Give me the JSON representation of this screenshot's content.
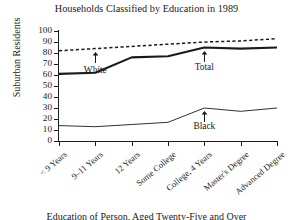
{
  "chart_data": {
    "type": "line",
    "title": "Households Classified by Education in 1989",
    "xlabel": "Education of Person, Aged Twenty-Five and Over",
    "ylabel": "Suburban Residents",
    "categories": [
      "< 9 Years",
      "9–11 Years",
      "12 Years",
      "Some College",
      "College, 4 Years",
      "Master's Degree",
      "Advanced Degree"
    ],
    "ylim": [
      0,
      100
    ],
    "yticks": [
      0,
      10,
      20,
      30,
      40,
      50,
      60,
      70,
      80,
      90,
      100
    ],
    "grid": false,
    "legend": "inline-annotations",
    "series": [
      {
        "name": "White",
        "style": "dashed",
        "values": [
          82,
          84,
          86,
          88,
          90,
          91,
          93
        ]
      },
      {
        "name": "Total",
        "style": "solid-thick",
        "values": [
          61,
          62,
          76,
          77,
          85,
          84,
          85
        ]
      },
      {
        "name": "Black",
        "style": "solid-thin",
        "values": [
          14,
          13,
          15,
          17,
          30,
          27,
          30
        ]
      }
    ],
    "annotations": [
      {
        "label": "White",
        "series": "White",
        "category_index": 1
      },
      {
        "label": "Total",
        "series": "Total",
        "category_index": 4
      },
      {
        "label": "Black",
        "series": "Black",
        "category_index": 4
      }
    ]
  },
  "colors": {
    "ink": "#1a1a1a",
    "background": "#ffffff"
  }
}
